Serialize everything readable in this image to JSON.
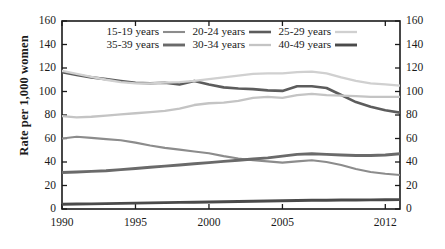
{
  "chart_data": {
    "type": "line",
    "title": "",
    "xlabel": "",
    "ylabel": "Rate per 1,000 women",
    "xlim": [
      1990,
      2013
    ],
    "ylim": [
      0,
      160
    ],
    "ytick_values": [
      0,
      20,
      40,
      60,
      80,
      100,
      120,
      140,
      160
    ],
    "ytick_labels": [
      "0",
      "20",
      "40",
      "60",
      "80",
      "100",
      "120",
      "140",
      "160"
    ],
    "ytick_labels_right": [
      "0",
      "20",
      "40",
      "60",
      "80",
      "100",
      "120",
      "140",
      "160"
    ],
    "xtick_values": [
      1990,
      1995,
      2000,
      2005,
      2012
    ],
    "xtick_labels": [
      "1990",
      "1995",
      "2000",
      "2005",
      "2012"
    ],
    "grid": false,
    "legend_position": "top-center",
    "x": [
      1990,
      1991,
      1992,
      1993,
      1994,
      1995,
      1996,
      1997,
      1998,
      1999,
      2000,
      2001,
      2002,
      2003,
      2004,
      2005,
      2006,
      2007,
      2008,
      2009,
      2010,
      2011,
      2012,
      2013
    ],
    "series": [
      {
        "name": "15-19 years",
        "color": "#8c8c8c",
        "width": 2.1,
        "values": [
          60.0,
          61.5,
          60.5,
          59.5,
          58.5,
          56.5,
          54.0,
          52.0,
          50.5,
          49.0,
          47.5,
          45.0,
          43.0,
          41.5,
          40.5,
          39.5,
          40.5,
          41.5,
          40.0,
          37.5,
          34.0,
          31.5,
          30.0,
          29.0
        ]
      },
      {
        "name": "20-24 years",
        "color": "#5c5c5c",
        "width": 2.6,
        "values": [
          116.5,
          114.0,
          112.0,
          110.5,
          109.0,
          107.5,
          107.0,
          107.5,
          106.0,
          109.0,
          106.0,
          103.5,
          102.5,
          102.0,
          101.0,
          100.5,
          104.5,
          104.5,
          103.0,
          97.0,
          91.0,
          87.0,
          84.0,
          82.0
        ]
      },
      {
        "name": "25-29 years",
        "color": "#d0d0d0",
        "width": 2.3,
        "values": [
          117.5,
          115.0,
          112.5,
          110.0,
          108.0,
          107.0,
          107.0,
          107.5,
          108.0,
          109.0,
          110.5,
          112.0,
          113.5,
          115.0,
          115.5,
          115.5,
          116.5,
          117.0,
          115.5,
          112.0,
          109.0,
          107.0,
          106.0,
          105.0
        ]
      },
      {
        "name": "35-39 years",
        "color": "#6a6a6a",
        "width": 2.9,
        "values": [
          31.0,
          31.5,
          32.0,
          32.5,
          33.5,
          34.5,
          35.5,
          36.5,
          37.5,
          38.5,
          39.5,
          40.5,
          41.5,
          42.5,
          43.5,
          45.0,
          46.5,
          47.0,
          46.5,
          46.0,
          45.5,
          45.5,
          46.0,
          47.0
        ]
      },
      {
        "name": "30-34 years",
        "color": "#c4c4c4",
        "width": 2.3,
        "values": [
          79.0,
          78.0,
          78.5,
          79.5,
          80.5,
          81.5,
          82.5,
          83.5,
          85.5,
          88.5,
          90.0,
          90.5,
          92.0,
          94.5,
          95.5,
          94.5,
          97.0,
          98.0,
          97.0,
          96.5,
          96.0,
          95.5,
          95.5,
          95.5
        ]
      },
      {
        "name": "40-49 years",
        "color": "#4a4a4a",
        "width": 2.9,
        "values": [
          4.0,
          4.2,
          4.4,
          4.6,
          4.8,
          5.0,
          5.2,
          5.4,
          5.6,
          5.8,
          6.0,
          6.2,
          6.4,
          6.6,
          6.8,
          7.0,
          7.2,
          7.4,
          7.5,
          7.6,
          7.7,
          7.8,
          7.9,
          8.0
        ]
      }
    ]
  },
  "legend": {
    "row1": [
      {
        "label": "15-19 years",
        "color": "#8c8c8c",
        "width": 2.1
      },
      {
        "label": "20-24 years",
        "color": "#5c5c5c",
        "width": 2.6
      },
      {
        "label": "25-29 years",
        "color": "#d0d0d0",
        "width": 2.3
      }
    ],
    "row2": [
      {
        "label": "35-39 years",
        "color": "#6a6a6a",
        "width": 2.9
      },
      {
        "label": "30-34 years",
        "color": "#c4c4c4",
        "width": 2.3
      },
      {
        "label": "40-49 years",
        "color": "#4a4a4a",
        "width": 2.9
      }
    ]
  },
  "axes": {
    "frame_color": "#1a1a1a",
    "background": "#ffffff"
  }
}
